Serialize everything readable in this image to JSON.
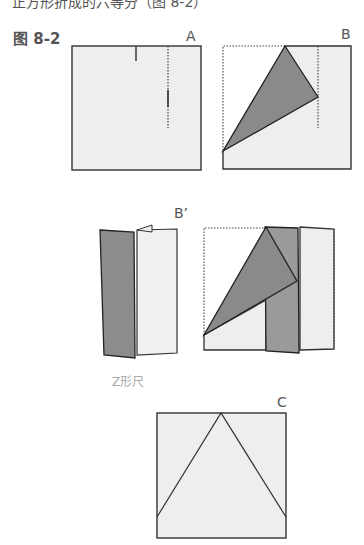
{
  "page": {
    "cutoff_text": "正方形折成的六等分（图 8-2）",
    "figure_title": "图 8-2"
  },
  "labels": {
    "a": "A",
    "b": "B",
    "b_prime": "B’",
    "c": "C"
  },
  "captions": {
    "z_fold": "Z形尺"
  },
  "colors": {
    "paper": "#eeeeee",
    "fold_dark": "#8a8a8a",
    "fold_mid": "#9a9a9a",
    "line": "#333333"
  }
}
